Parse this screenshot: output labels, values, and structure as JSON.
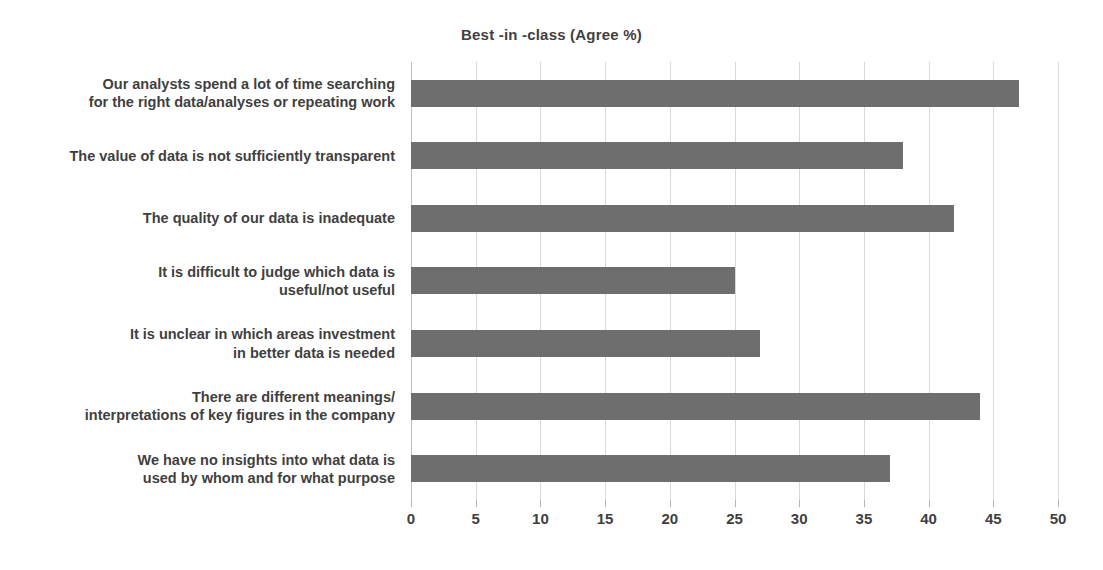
{
  "chart_data": {
    "type": "bar",
    "orientation": "horizontal",
    "title": "Best -in -class (Agree %)",
    "xlabel": "",
    "ylabel": "",
    "xlim": [
      0,
      50
    ],
    "xticks": [
      0,
      5,
      10,
      15,
      20,
      25,
      30,
      35,
      40,
      45,
      50
    ],
    "grid": true,
    "legend": null,
    "bar_color": "#6e6e6e",
    "text_color": "#3f3f3f",
    "gridline_color": "#d9d9d9",
    "categories": [
      "Our analysts spend a lot of time searching for the right data/analyses or repeating work",
      "The value of data is not sufficiently transparent",
      "The quality of our data is inadequate",
      "It is difficult to judge which data is useful/not useful",
      "It is unclear in which areas investment in better data is needed",
      "There are different meanings/ interpretations of key figures in the company",
      "We have no insights into what data is used by whom and for what purpose"
    ],
    "category_lines": [
      [
        "Our analysts spend a lot of time searching",
        "for the right data/analyses or repeating work"
      ],
      [
        "The value of data is not sufficiently transparent"
      ],
      [
        "The quality of our data is inadequate"
      ],
      [
        "It is difficult to judge which data is",
        "useful/not useful"
      ],
      [
        "It is unclear in which areas investment",
        "in better data is needed"
      ],
      [
        "There are different meanings/",
        "interpretations of key figures in the company"
      ],
      [
        "We have no insights into what data is",
        "used by whom and for what purpose"
      ]
    ],
    "values": [
      47,
      38,
      42,
      25,
      27,
      44,
      37
    ]
  }
}
